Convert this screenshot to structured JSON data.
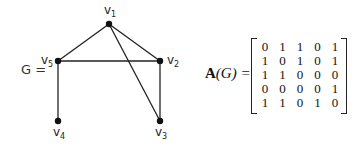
{
  "graph": {
    "name": "G",
    "label": "G =",
    "vertices": [
      {
        "id": "v1",
        "label": "v",
        "sub": "1",
        "x": 109,
        "y": 24
      },
      {
        "id": "v2",
        "label": "v",
        "sub": "2",
        "x": 160,
        "y": 61
      },
      {
        "id": "v3",
        "label": "v",
        "sub": "3",
        "x": 160,
        "y": 121
      },
      {
        "id": "v4",
        "label": "v",
        "sub": "4",
        "x": 58,
        "y": 121
      },
      {
        "id": "v5",
        "label": "v",
        "sub": "5",
        "x": 58,
        "y": 61
      }
    ],
    "edges": [
      [
        "v1",
        "v2"
      ],
      [
        "v1",
        "v3"
      ],
      [
        "v1",
        "v5"
      ],
      [
        "v2",
        "v5"
      ],
      [
        "v2",
        "v3"
      ],
      [
        "v4",
        "v5"
      ]
    ]
  },
  "matrix": {
    "label_bold": "A",
    "label_rest": "(G) =",
    "rows": [
      [
        "0",
        "1",
        "1",
        "0",
        "1"
      ],
      [
        "1",
        "0",
        "1",
        "0",
        "1"
      ],
      [
        "1",
        "1",
        "0",
        "0",
        "0"
      ],
      [
        "0",
        "0",
        "0",
        "0",
        "1"
      ],
      [
        "1",
        "1",
        "0",
        "1",
        "0"
      ]
    ]
  }
}
